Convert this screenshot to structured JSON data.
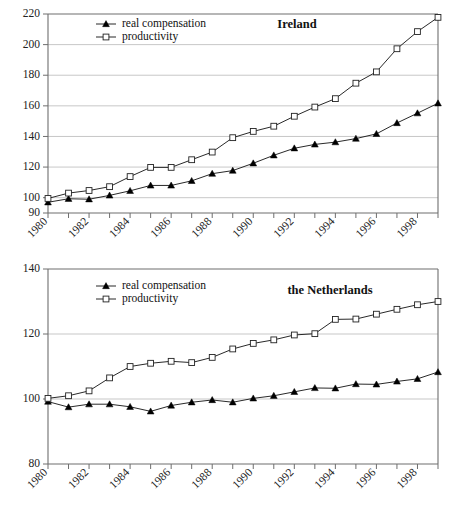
{
  "figure": {
    "background": "#ffffff",
    "series_colors": {
      "real_compensation": "#000000",
      "productivity": "#ffffff",
      "line": "#111111",
      "grid": "#b9b9b9",
      "axis": "#6e6e6e"
    }
  },
  "chart_data": [
    {
      "type": "line",
      "title": "Ireland",
      "xlabel": "",
      "ylabel": "",
      "xlim": [
        1980,
        1999
      ],
      "ylim": [
        90,
        220
      ],
      "yticks": [
        90,
        110,
        130,
        150,
        170,
        190,
        210
      ],
      "ytick_labels_shown": [
        90,
        100,
        120,
        140,
        160,
        180,
        200,
        220
      ],
      "grid": true,
      "legend_position": "top-left",
      "x": [
        1980,
        1981,
        1982,
        1983,
        1984,
        1985,
        1986,
        1987,
        1988,
        1989,
        1990,
        1991,
        1992,
        1993,
        1994,
        1995,
        1996,
        1997,
        1998,
        1999
      ],
      "xtick_labels": [
        "1980",
        "1982",
        "1984",
        "1986",
        "1988",
        "1990",
        "1992",
        "1994",
        "1996",
        "1998"
      ],
      "series": [
        {
          "name": "real compensation",
          "marker": "filled-triangle",
          "values": [
            97.0,
            99.3,
            99.0,
            101.5,
            104.5,
            108.0,
            108.0,
            111.0,
            115.7,
            117.7,
            122.5,
            127.7,
            132.3,
            134.8,
            136.3,
            138.6,
            141.7,
            148.8,
            155.2,
            161.7
          ]
        },
        {
          "name": "productivity",
          "marker": "open-square",
          "values": [
            99.5,
            103.0,
            104.7,
            107.2,
            113.8,
            119.8,
            119.8,
            124.8,
            129.8,
            139.2,
            143.3,
            146.7,
            153.2,
            159.2,
            164.7,
            174.8,
            182.2,
            197.3,
            208.5,
            217.8
          ]
        }
      ]
    },
    {
      "type": "line",
      "title": "the Netherlands",
      "xlabel": "",
      "ylabel": "",
      "xlim": [
        1980,
        1999
      ],
      "ylim": [
        80,
        140
      ],
      "yticks": [
        80,
        90,
        100,
        110,
        120,
        130,
        140
      ],
      "ytick_labels_shown": [
        80,
        100,
        120,
        140
      ],
      "grid": true,
      "legend_position": "top-left",
      "x": [
        1980,
        1981,
        1982,
        1983,
        1984,
        1985,
        1986,
        1987,
        1988,
        1989,
        1990,
        1991,
        1992,
        1993,
        1994,
        1995,
        1996,
        1997,
        1998,
        1999
      ],
      "xtick_labels": [
        "1980",
        "1982",
        "1984",
        "1986",
        "1988",
        "1990",
        "1992",
        "1994",
        "1996",
        "1998"
      ],
      "series": [
        {
          "name": "real compensation",
          "marker": "filled-triangle",
          "values": [
            99.2,
            97.5,
            98.4,
            98.4,
            97.6,
            96.2,
            98.0,
            99.0,
            99.7,
            99.0,
            100.2,
            101.0,
            102.2,
            103.4,
            103.3,
            104.6,
            104.5,
            105.4,
            106.2,
            108.3
          ]
        },
        {
          "name": "productivity",
          "marker": "open-square",
          "values": [
            100.2,
            101.0,
            102.5,
            106.5,
            110.0,
            111.0,
            111.6,
            111.2,
            112.8,
            115.4,
            117.1,
            118.2,
            119.7,
            120.1,
            124.5,
            124.6,
            126.1,
            127.6,
            129.0,
            130.0
          ]
        }
      ]
    }
  ],
  "legend": {
    "items": [
      {
        "label": "real compensation",
        "marker": "filled-triangle"
      },
      {
        "label": "productivity",
        "marker": "open-square"
      }
    ]
  }
}
